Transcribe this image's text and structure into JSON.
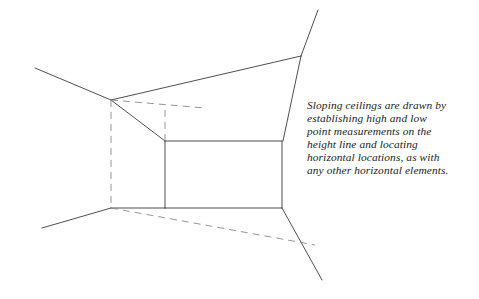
{
  "page": {
    "width": 479,
    "height": 299,
    "background_color": "#ffffff"
  },
  "caption": {
    "text": "Sloping ceilings are drawn by establishing high and low point measurements on the height line and locating horizontal locations, as with any other horizontal elements.",
    "lines": [
      "Sloping ceilings are drawn",
      "by establishing high and low",
      "point measurements on the",
      "height line and locating",
      "horizontal locations, as",
      "with any other horizontal",
      "elements."
    ],
    "color": "#1b1b1b",
    "style": "italic-serif"
  },
  "diagram": {
    "type": "line-drawing",
    "stroke_color": "#3a3a3a",
    "dashed_color": "#8a8a8a",
    "stroke_width": 0.9,
    "dash_pattern": "7 5",
    "points": {
      "ceiling_peak_left": [
        111,
        100
      ],
      "slope_break_inner": [
        165,
        141
      ],
      "wall_right_top": [
        282,
        141
      ],
      "wall_right_bottom": [
        282,
        208
      ],
      "floor_left_corner": [
        111,
        208
      ],
      "ceiling_upper_right_vertex": [
        301,
        56
      ],
      "left_ceiling_line_start": [
        35,
        68
      ],
      "left_floor_line_start": [
        42,
        228
      ],
      "upper_right_line_end": [
        318,
        10
      ],
      "lower_right_line_end": [
        322,
        280
      ],
      "dashed_ceiling_end": [
        205,
        108
      ],
      "dashed_floor_end": [
        315,
        245
      ],
      "dashed_inner_vertical_top": [
        165,
        110
      ]
    },
    "solid_lines": [
      {
        "name": "left-ceiling-edge",
        "from": [
          35,
          68
        ],
        "to": [
          111,
          100
        ]
      },
      {
        "name": "ceiling-slope-top-right",
        "from": [
          111,
          100
        ],
        "to": [
          301,
          56
        ]
      },
      {
        "name": "ceiling-slope-inner",
        "from": [
          111,
          100
        ],
        "to": [
          165,
          141
        ]
      },
      {
        "name": "ceiling-plane-right-edge",
        "from": [
          165,
          141
        ],
        "to": [
          282,
          141
        ]
      },
      {
        "name": "back-wall-right-vertical",
        "from": [
          282,
          141
        ],
        "to": [
          282,
          208
        ]
      },
      {
        "name": "back-wall-left-vertical",
        "from": [
          165,
          141
        ],
        "to": [
          165,
          208
        ]
      },
      {
        "name": "floor-back-edge",
        "from": [
          165,
          208
        ],
        "to": [
          282,
          208
        ]
      },
      {
        "name": "floor-left-edge",
        "from": [
          111,
          208
        ],
        "to": [
          165,
          208
        ]
      },
      {
        "name": "left-floor-receding-line",
        "from": [
          42,
          228
        ],
        "to": [
          111,
          208
        ]
      },
      {
        "name": "right-ceiling-receding-line",
        "from": [
          301,
          56
        ],
        "to": [
          318,
          10
        ]
      },
      {
        "name": "right-wall-corner-line",
        "from": [
          301,
          56
        ],
        "to": [
          283,
          141
        ]
      },
      {
        "name": "right-floor-receding-line",
        "from": [
          282,
          208
        ],
        "to": [
          322,
          280
        ]
      }
    ],
    "dashed_lines": [
      {
        "name": "hidden-left-wall-vertical",
        "from": [
          111,
          100
        ],
        "to": [
          111,
          208
        ]
      },
      {
        "name": "hidden-ceiling-horizontal",
        "from": [
          111,
          100
        ],
        "to": [
          205,
          108
        ]
      },
      {
        "name": "hidden-inner-vertical",
        "from": [
          165,
          110
        ],
        "to": [
          165,
          141
        ]
      },
      {
        "name": "hidden-floor-receding",
        "from": [
          111,
          208
        ],
        "to": [
          315,
          245
        ]
      }
    ]
  }
}
